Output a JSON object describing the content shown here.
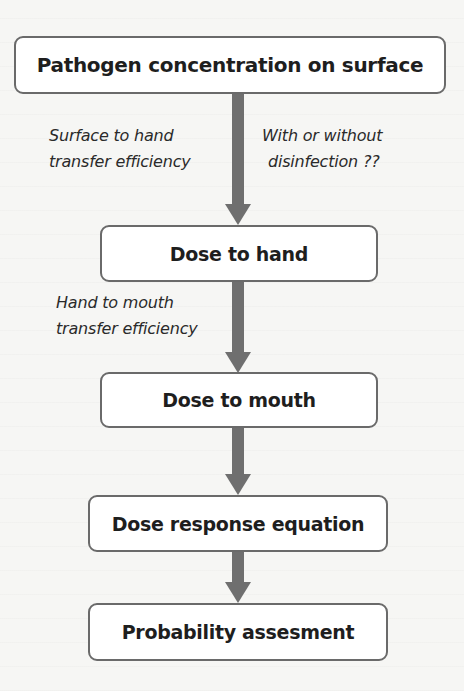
{
  "diagram": {
    "type": "flowchart",
    "direction": "top-to-bottom",
    "colors": {
      "node_border": "#6a6a6a",
      "node_fill": "#ffffff",
      "arrow": "#6f6f6f",
      "text": "#1e1e1e"
    },
    "nodes": [
      {
        "id": "n1",
        "label": "Pathogen concentration on surface"
      },
      {
        "id": "n2",
        "label": "Dose to hand"
      },
      {
        "id": "n3",
        "label": "Dose to mouth"
      },
      {
        "id": "n4",
        "label": "Dose response equation"
      },
      {
        "id": "n5",
        "label": "Probability assesment"
      }
    ],
    "edges": [
      {
        "from": "n1",
        "to": "n2",
        "left_label": [
          "Surface to hand",
          "transfer efficiency"
        ],
        "right_label": [
          "With or without",
          "disinfection ??"
        ]
      },
      {
        "from": "n2",
        "to": "n3",
        "left_label": [
          "Hand to mouth",
          "transfer efficiency"
        ]
      },
      {
        "from": "n3",
        "to": "n4"
      },
      {
        "from": "n4",
        "to": "n5"
      }
    ]
  }
}
